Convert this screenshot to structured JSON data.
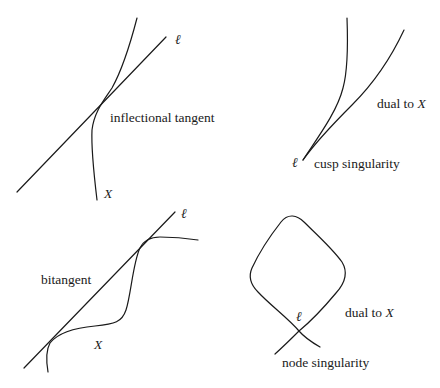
{
  "panels": {
    "inflection": {
      "line_label": "ℓ",
      "caption": "inflectional tangent",
      "curve_label": "X"
    },
    "cusp": {
      "dual_label_prefix": "dual to ",
      "dual_label_var": "X",
      "point_label": "ℓ",
      "caption": "cusp singularity"
    },
    "bitangent": {
      "line_label": "ℓ",
      "caption": "bitangent",
      "curve_label": "X"
    },
    "node": {
      "dual_label_prefix": "dual to ",
      "dual_label_var": "X",
      "point_label": "ℓ",
      "caption": "node singularity"
    }
  },
  "colors": {
    "stroke": "#1a1a1a",
    "background": "#ffffff"
  }
}
